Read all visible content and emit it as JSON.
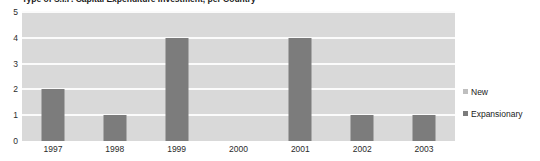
{
  "chart_data": {
    "type": "bar",
    "title": "Type of S.I.F. Capital Expenditure Investment, per Country",
    "xlabel": "",
    "ylabel": "",
    "categories": [
      "1997",
      "1998",
      "1999",
      "2000",
      "2001",
      "2002",
      "2003"
    ],
    "series": [
      {
        "name": "New",
        "color": "#bfbfbf",
        "values": [
          0,
          0,
          0,
          0,
          0,
          0,
          0
        ]
      },
      {
        "name": "Expansionary",
        "color": "#7c7c7c",
        "values": [
          2,
          1,
          4,
          0,
          4,
          1,
          1
        ]
      }
    ],
    "ylim": [
      0,
      5
    ],
    "yticks": [
      "0",
      "1",
      "2",
      "3",
      "4",
      "5"
    ],
    "grid": true,
    "legend_position": "right",
    "plot_background": "#d9d9d9",
    "gridline_color": "#fbfbfb"
  },
  "legend": {
    "items": [
      {
        "label": "New",
        "color": "#bfbfbf"
      },
      {
        "label": "Expansionary",
        "color": "#7c7c7c"
      }
    ]
  }
}
